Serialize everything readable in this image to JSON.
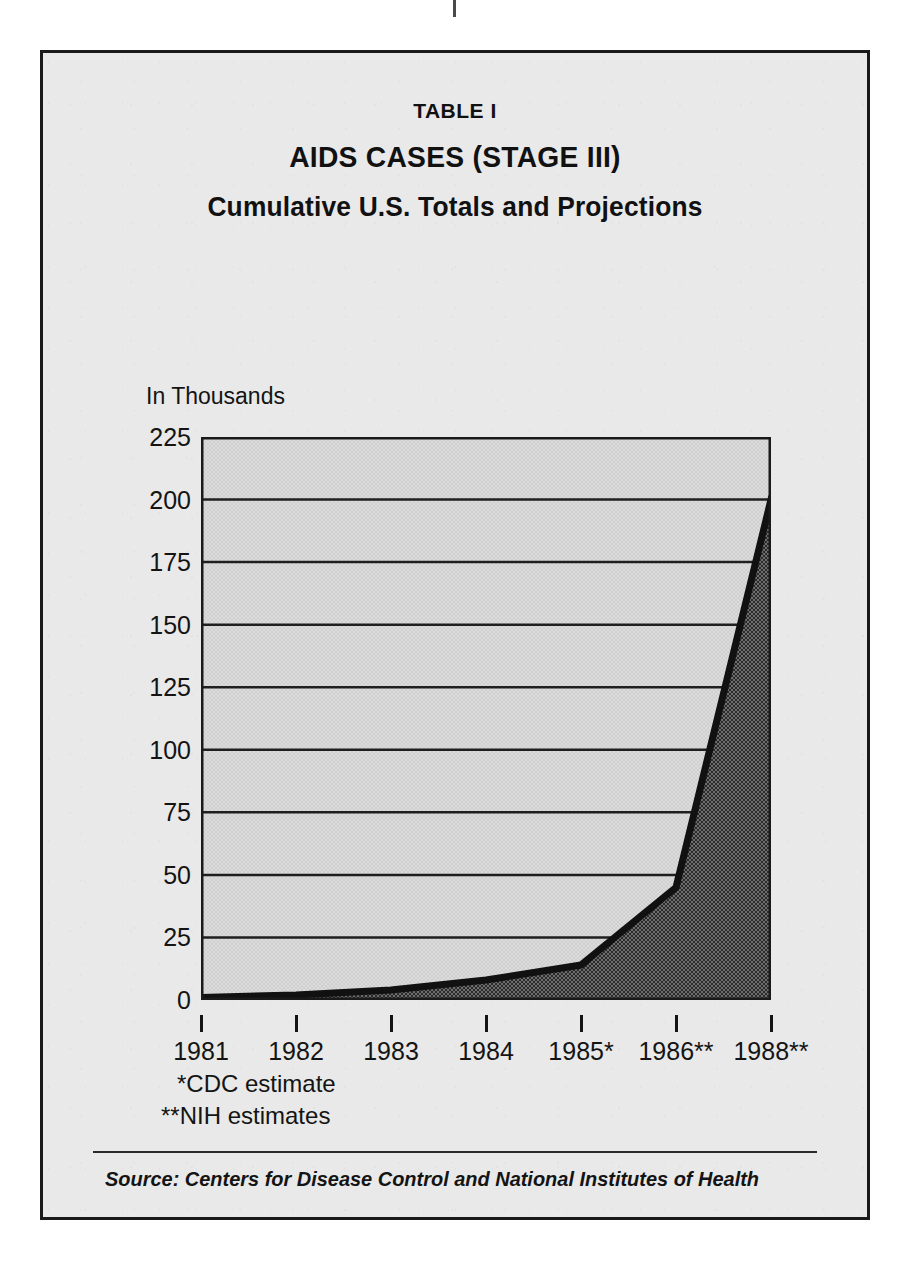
{
  "figure": {
    "table_number": "TABLE I",
    "title": "AIDS CASES (STAGE III)",
    "subtitle": "Cumulative U.S. Totals and Projections",
    "axis_caption": "In Thousands",
    "footnotes": [
      "*CDC estimate",
      "**NIH estimates"
    ],
    "source": "Source: Centers for Disease Control and National Institutes of Health"
  },
  "colors": {
    "page_background": "#ffffff",
    "panel_background": "#e9e9e9",
    "border": "#1a1a1a",
    "plot_background": "#d8d8d8",
    "area_fill": "#4f4f4f",
    "line": "#111111",
    "gridline": "#1f1f1f",
    "text": "#141414"
  },
  "chart_data": {
    "type": "area",
    "xlabel": "",
    "ylabel": "In Thousands",
    "categories": [
      "1981",
      "1982",
      "1983",
      "1984",
      "1985*",
      "1986**",
      "1988**"
    ],
    "x_tick_labels": [
      "1981",
      "1982",
      "1983",
      "1984",
      "1985*",
      "1986**",
      "1988**"
    ],
    "values": [
      1,
      2,
      4,
      8,
      14,
      45,
      200
    ],
    "series": [
      {
        "name": "Cumulative U.S. AIDS cases (thousands)",
        "values": [
          1,
          2,
          4,
          8,
          14,
          45,
          200
        ]
      }
    ],
    "ylim": [
      0,
      225
    ],
    "y_ticks": [
      0,
      25,
      50,
      75,
      100,
      125,
      150,
      175,
      200,
      225
    ],
    "y_tick_labels": [
      "0",
      "25",
      "50",
      "75",
      "100",
      "125",
      "150",
      "175",
      "200",
      "225"
    ],
    "grid": true,
    "grid_axis": "y",
    "legend": false,
    "legend_position": "none",
    "annotations": [
      "*CDC estimate",
      "**NIH estimates"
    ],
    "units": "thousands of cases"
  }
}
